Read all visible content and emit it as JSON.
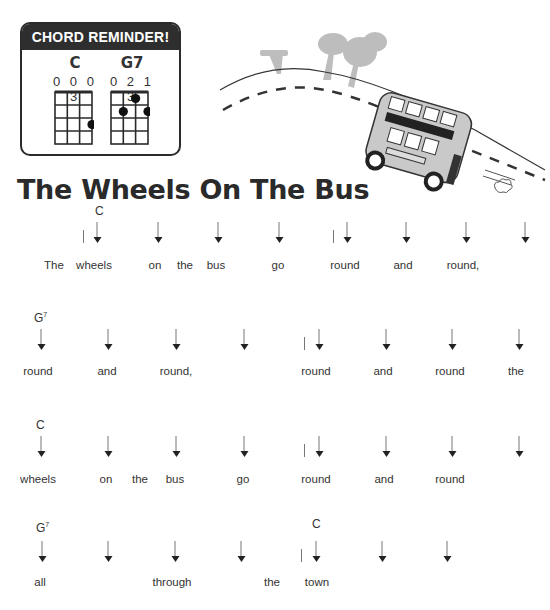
{
  "chord_reminder": {
    "title": "CHORD REMINDER!",
    "chords": [
      {
        "name": "C",
        "fingering": "0003",
        "dots": [
          {
            "string": 4,
            "fret": 3
          }
        ]
      },
      {
        "name": "G7",
        "fingering": "0213",
        "dots": [
          {
            "string": 3,
            "fret": 1
          },
          {
            "string": 2,
            "fret": 2
          },
          {
            "string": 4,
            "fret": 2
          }
        ]
      }
    ]
  },
  "illustration": {
    "description": "double-decker bus driving down a hill with trees"
  },
  "song": {
    "title": "The Wheels On The Bus",
    "lines": [
      {
        "chords": [
          {
            "name": "C",
            "sup": "",
            "x": 95,
            "y": 204
          }
        ],
        "bars": [
          {
            "x": 83,
            "y": 230
          },
          {
            "x": 333,
            "y": 230
          }
        ],
        "arrow_y": 222,
        "arrows": [
          97,
          158,
          218,
          279,
          347,
          406,
          466,
          525
        ],
        "lyric_y": 259,
        "words": [
          {
            "text": "The",
            "x": 54
          },
          {
            "text": "wheels",
            "x": 94
          },
          {
            "text": "on",
            "x": 155
          },
          {
            "text": "the",
            "x": 185
          },
          {
            "text": "bus",
            "x": 216
          },
          {
            "text": "go",
            "x": 278
          },
          {
            "text": "round",
            "x": 345
          },
          {
            "text": "and",
            "x": 403
          },
          {
            "text": "round,",
            "x": 463
          }
        ]
      },
      {
        "chords": [
          {
            "name": "G",
            "sup": "7",
            "x": 34,
            "y": 311
          }
        ],
        "bars": [
          {
            "x": 304,
            "y": 337
          }
        ],
        "arrow_y": 329,
        "arrows": [
          41,
          108,
          176,
          244,
          319,
          386,
          452,
          519
        ],
        "lyric_y": 365,
        "words": [
          {
            "text": "round",
            "x": 38
          },
          {
            "text": "and",
            "x": 107
          },
          {
            "text": "round,",
            "x": 176
          },
          {
            "text": "round",
            "x": 316
          },
          {
            "text": "and",
            "x": 383
          },
          {
            "text": "round",
            "x": 450
          },
          {
            "text": "the",
            "x": 516
          }
        ]
      },
      {
        "chords": [
          {
            "name": "C",
            "sup": "",
            "x": 36,
            "y": 418
          }
        ],
        "bars": [
          {
            "x": 304,
            "y": 444
          }
        ],
        "arrow_y": 436,
        "arrows": [
          41,
          108,
          176,
          244,
          319,
          386,
          452,
          519
        ],
        "lyric_y": 473,
        "words": [
          {
            "text": "wheels",
            "x": 38
          },
          {
            "text": "on",
            "x": 106
          },
          {
            "text": "the",
            "x": 140
          },
          {
            "text": "bus",
            "x": 175
          },
          {
            "text": "go",
            "x": 243
          },
          {
            "text": "round",
            "x": 316
          },
          {
            "text": "and",
            "x": 384
          },
          {
            "text": "round",
            "x": 450
          }
        ]
      },
      {
        "chords": [
          {
            "name": "G",
            "sup": "7",
            "x": 36,
            "y": 521
          },
          {
            "name": "C",
            "sup": "",
            "x": 312,
            "y": 517
          }
        ],
        "bars": [
          {
            "x": 301,
            "y": 549
          }
        ],
        "arrow_y": 541,
        "arrows": [
          42,
          108,
          175,
          241,
          316,
          382,
          447
        ],
        "lyric_y": 576,
        "words": [
          {
            "text": "all",
            "x": 40
          },
          {
            "text": "through",
            "x": 172
          },
          {
            "text": "the",
            "x": 272
          },
          {
            "text": "town",
            "x": 317
          }
        ]
      }
    ]
  }
}
